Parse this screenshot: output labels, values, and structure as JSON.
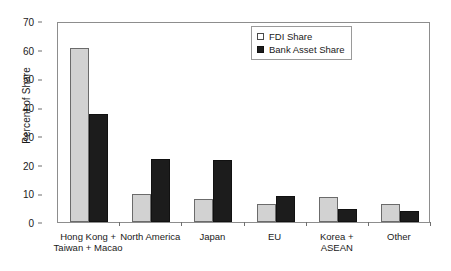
{
  "chart_data": {
    "type": "bar",
    "title": "",
    "xlabel": "",
    "ylabel": "Percent of Share",
    "ylim": [
      0,
      70
    ],
    "ytick_step": 10,
    "yticks": [
      0,
      10,
      20,
      30,
      40,
      50,
      60,
      70
    ],
    "grid": false,
    "legend_position": "top-right",
    "categories": [
      "Hong Kong +\nTaiwan + Macao",
      "North America",
      "Japan",
      "EU",
      "Korea +\nASEAN",
      "Other"
    ],
    "category_lines": [
      [
        "Hong Kong +",
        "Taiwan + Macao"
      ],
      [
        "North America",
        ""
      ],
      [
        "Japan",
        ""
      ],
      [
        "EU",
        ""
      ],
      [
        "Korea +",
        "ASEAN"
      ],
      [
        "Other",
        ""
      ]
    ],
    "series": [
      {
        "name": "FDI  Share",
        "color": "#d2d2d2",
        "values": [
          60.6,
          9.6,
          8.0,
          6.2,
          8.6,
          6.3
        ]
      },
      {
        "name": "Bank Asset Share",
        "color": "#1c1c1c",
        "values": [
          37.5,
          22.0,
          21.6,
          9.1,
          4.6,
          4.0
        ]
      }
    ]
  },
  "legend": {
    "items": [
      {
        "label": "FDI  Share",
        "swatch": "fdi"
      },
      {
        "label": "Bank Asset Share",
        "swatch": "bank"
      }
    ]
  },
  "axis": {
    "y_title": "Percent of Share"
  }
}
